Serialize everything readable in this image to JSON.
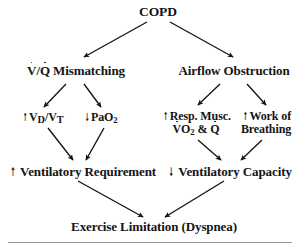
{
  "diagram": {
    "ink_color": "#141414",
    "rule_color": "#9a9a9a",
    "background": "#ffffff"
  },
  "nodes": {
    "copd": {
      "label": "COPD"
    },
    "vq_mismatching": {
      "prefix": "",
      "v_symbol": "V",
      "slash": "/",
      "q_symbol": "Q",
      "label": " Mismatching",
      "full_text": "V̇/Q̇ Mismatching"
    },
    "airflow_obstruction": {
      "label": "Airflow Obstruction"
    },
    "vd_vt": {
      "change": "↑",
      "change_direction": "increase",
      "base": "V",
      "sub1": "D",
      "slash": "/V",
      "sub2": "T",
      "full_text": "↑ VD/VT"
    },
    "pao2": {
      "change": "↓",
      "change_direction": "decrease",
      "base": "PaO",
      "sub": "2",
      "full_text": "↓ PaO2"
    },
    "resp_musc": {
      "change": "↑",
      "change_direction": "increase",
      "line1": "Resp. Musc.",
      "line2_v": "V",
      "line2_o": "O",
      "line2_sub": "2",
      "line2_amp": " & ",
      "line2_q": "Q",
      "full_text": "↑ Resp. Musc. V̇O2 & Q̇"
    },
    "work_breathing": {
      "change": "↑",
      "change_direction": "increase",
      "line1": "Work of",
      "line2": "Breathing",
      "full_text": "↑ Work of Breathing"
    },
    "vent_requirement": {
      "change": "↑",
      "change_direction": "increase",
      "label": " Ventilatory Requirement",
      "full_text": "↑ Ventilatory Requirement"
    },
    "vent_capacity": {
      "change": "↓",
      "change_direction": "decrease",
      "label": " Ventilatory Capacity",
      "full_text": "↓ Ventilatory Capacity"
    },
    "exercise_limitation": {
      "label": "Exercise Limitation (Dyspnea)"
    }
  },
  "edges": [
    {
      "name": "copd-to-vq",
      "from": "copd",
      "to": "vq_mismatching",
      "x1": 147,
      "y1": 22,
      "x2": 84,
      "y2": 57
    },
    {
      "name": "copd-to-airflow",
      "from": "copd",
      "to": "airflow_obstruction",
      "x1": 170,
      "y1": 22,
      "x2": 233,
      "y2": 57
    },
    {
      "name": "vq-to-vdvt",
      "from": "vq_mismatching",
      "to": "vd_vt",
      "x1": 66,
      "y1": 84,
      "x2": 44,
      "y2": 107
    },
    {
      "name": "vq-to-pao2",
      "from": "vq_mismatching",
      "to": "pao2",
      "x1": 84,
      "y1": 84,
      "x2": 101,
      "y2": 107
    },
    {
      "name": "airflow-to-respmusc",
      "from": "airflow_obstruction",
      "to": "resp_musc",
      "x1": 220,
      "y1": 84,
      "x2": 198,
      "y2": 105
    },
    {
      "name": "airflow-to-work",
      "from": "airflow_obstruction",
      "to": "work_breathing",
      "x1": 247,
      "y1": 84,
      "x2": 266,
      "y2": 105
    },
    {
      "name": "vdvt-to-ventreq",
      "from": "vd_vt",
      "to": "vent_requirement",
      "x1": 48,
      "y1": 128,
      "x2": 73,
      "y2": 160
    },
    {
      "name": "pao2-to-ventreq",
      "from": "pao2",
      "to": "vent_requirement",
      "x1": 104,
      "y1": 128,
      "x2": 86,
      "y2": 160
    },
    {
      "name": "respmusc-to-ventcap",
      "from": "resp_musc",
      "to": "vent_capacity",
      "x1": 198,
      "y1": 140,
      "x2": 221,
      "y2": 160
    },
    {
      "name": "work-to-ventcap",
      "from": "work_breathing",
      "to": "vent_capacity",
      "x1": 262,
      "y1": 140,
      "x2": 241,
      "y2": 160
    },
    {
      "name": "ventreq-to-exercise",
      "from": "vent_requirement",
      "to": "exercise_limitation",
      "x1": 78,
      "y1": 181,
      "x2": 143,
      "y2": 217
    },
    {
      "name": "ventcap-to-exercise",
      "from": "vent_capacity",
      "to": "exercise_limitation",
      "x1": 224,
      "y1": 181,
      "x2": 165,
      "y2": 217
    }
  ]
}
